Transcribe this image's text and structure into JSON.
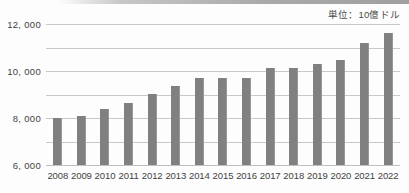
{
  "unit_note": "単位：10億ドル",
  "chart_data": {
    "type": "bar",
    "title": "",
    "subtitle": "",
    "xlabel": "",
    "ylabel": "",
    "unit_label": "単位：10億ドル",
    "categories": [
      "2008",
      "2009",
      "2010",
      "2011",
      "2012",
      "2013",
      "2014",
      "2015",
      "2016",
      "2017",
      "2018",
      "2019",
      "2020",
      "2021",
      "2022"
    ],
    "values": [
      4000,
      4180,
      4780,
      5300,
      6020,
      6720,
      7380,
      7430,
      7420,
      8280,
      8290,
      8620,
      8930,
      10380,
      11220
    ],
    "series": [
      {
        "name": "金額",
        "values": [
          4000,
          4180,
          4780,
          5300,
          6020,
          6720,
          7380,
          7430,
          7420,
          8280,
          8290,
          8620,
          8930,
          10380,
          11220
        ]
      }
    ],
    "ylim": [
      0,
      12000
    ],
    "ytick_values": [
      0,
      2000,
      4000,
      6000,
      8000,
      10000,
      12000
    ],
    "ytick_labels": [
      "0",
      "2, 000",
      "4, 000",
      "6, 000",
      "8, 000",
      "10, 000",
      "12, 000"
    ],
    "grid": true,
    "legend": "none",
    "bar_color": "#808080",
    "gridline_color": "#c9c9c9",
    "background_color": "#fdfdfd"
  }
}
